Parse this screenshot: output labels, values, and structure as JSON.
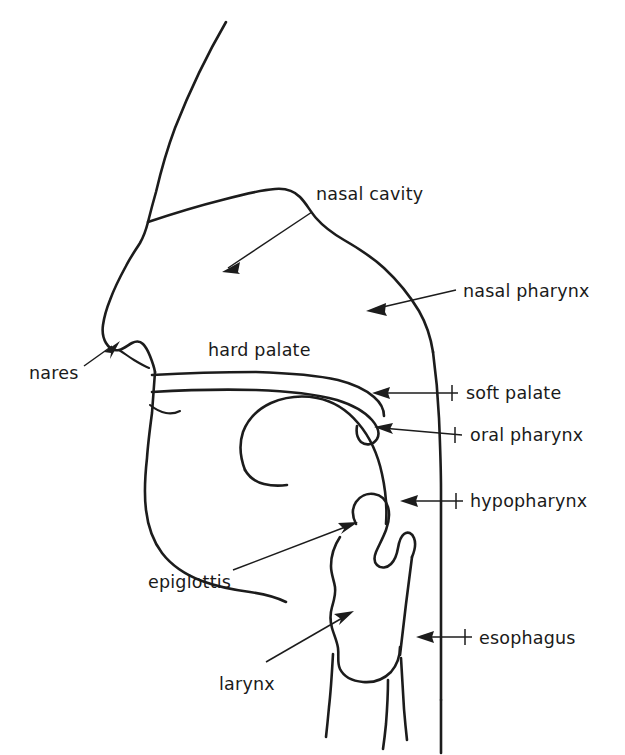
{
  "figure": {
    "kind": "anatomical-line-diagram",
    "orientation": "left-facing profile",
    "background_color": "#ffffff",
    "ink_color": "#1c1c1c",
    "width": 625,
    "height": 755
  },
  "labels": [
    {
      "id": "nasal-cavity",
      "text": "nasal cavity",
      "x": 316,
      "y": 200,
      "anchor": "start",
      "has_arrow": true,
      "arrow_from": [
        312,
        212
      ],
      "arrow_to": [
        222,
        272
      ],
      "arrow_direction": "down-left"
    },
    {
      "id": "nasal-pharynx",
      "text": "nasal pharynx",
      "x": 463,
      "y": 297,
      "anchor": "start",
      "has_arrow": true,
      "arrow_from": [
        456,
        290
      ],
      "arrow_to": [
        366,
        311
      ],
      "arrow_direction": "left"
    },
    {
      "id": "nares",
      "text": "nares",
      "x": 29,
      "y": 379,
      "anchor": "start",
      "has_arrow": true,
      "arrow_from": [
        84,
        366
      ],
      "arrow_to": [
        118,
        342
      ],
      "arrow_direction": "up-right"
    },
    {
      "id": "hard-palate",
      "text": "hard palate",
      "x": 208,
      "y": 356,
      "anchor": "start",
      "has_arrow": false,
      "arrow_from": null,
      "arrow_to": null,
      "arrow_direction": "none"
    },
    {
      "id": "soft-palate",
      "text": "soft palate",
      "x": 466,
      "y": 399,
      "anchor": "start",
      "has_arrow": true,
      "arrow_from": [
        458,
        393
      ],
      "arrow_to": [
        372,
        393
      ],
      "arrow_direction": "left"
    },
    {
      "id": "oral-pharynx",
      "text": "oral pharynx",
      "x": 470,
      "y": 441,
      "anchor": "start",
      "has_arrow": true,
      "arrow_from": [
        462,
        435
      ],
      "arrow_to": [
        374,
        427
      ],
      "arrow_direction": "left"
    },
    {
      "id": "hypopharynx",
      "text": "hypopharynx",
      "x": 470,
      "y": 507,
      "anchor": "start",
      "has_arrow": true,
      "arrow_from": [
        463,
        501
      ],
      "arrow_to": [
        400,
        501
      ],
      "arrow_direction": "left"
    },
    {
      "id": "epiglottis",
      "text": "epiglottis",
      "x": 148,
      "y": 588,
      "anchor": "start",
      "has_arrow": true,
      "arrow_from": [
        233,
        570
      ],
      "arrow_to": [
        356,
        522
      ],
      "arrow_direction": "up-right"
    },
    {
      "id": "larynx",
      "text": "larynx",
      "x": 219,
      "y": 690,
      "anchor": "start",
      "has_arrow": true,
      "arrow_from": [
        266,
        662
      ],
      "arrow_to": [
        352,
        612
      ],
      "arrow_direction": "up-right"
    },
    {
      "id": "esophagus",
      "text": "esophagus",
      "x": 479,
      "y": 644,
      "anchor": "start",
      "has_arrow": true,
      "arrow_from": [
        472,
        637
      ],
      "arrow_to": [
        416,
        637
      ],
      "arrow_direction": "left"
    }
  ],
  "structures": [
    {
      "id": "forehead-nose-profile",
      "name": "forehead and nose profile"
    },
    {
      "id": "nasal-cavity-roof",
      "name": "roof of nasal cavity / skull base"
    },
    {
      "id": "pharynx-back-wall",
      "name": "posterior pharyngeal wall"
    },
    {
      "id": "nostril-upper-lip",
      "name": "nostril and upper lip"
    },
    {
      "id": "hard-palate-upper",
      "name": "hard palate upper surface"
    },
    {
      "id": "hard-palate-lower",
      "name": "hard palate lower surface and soft palate"
    },
    {
      "id": "tongue",
      "name": "tongue"
    },
    {
      "id": "jaw-chin",
      "name": "mandible and chin"
    },
    {
      "id": "epiglottis-shape",
      "name": "epiglottis"
    },
    {
      "id": "larynx-body",
      "name": "larynx and thyroid cartilage"
    },
    {
      "id": "trachea",
      "name": "trachea"
    },
    {
      "id": "esophagus-tube",
      "name": "esophagus"
    },
    {
      "id": "neck-back",
      "name": "posterior neck line"
    }
  ]
}
